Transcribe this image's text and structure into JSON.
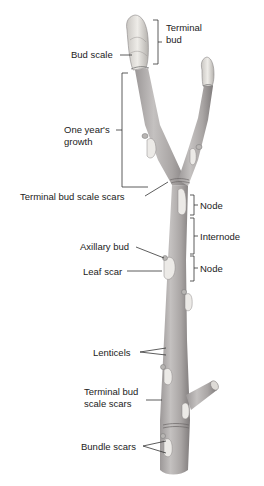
{
  "diagram": {
    "labels": {
      "terminal_bud_1": "Terminal",
      "terminal_bud_2": "bud",
      "bud_scale": "Bud scale",
      "one_years_growth_1": "One year's",
      "one_years_growth_2": "growth",
      "terminal_bud_scale_scars_top": "Terminal bud scale scars",
      "node_top": "Node",
      "internode": "Internode",
      "node_bottom": "Node",
      "axillary_bud": "Axillary bud",
      "leaf_scar": "Leaf scar",
      "lenticels": "Lenticels",
      "terminal_bud_scale_scars_bottom_1": "Terminal bud",
      "terminal_bud_scale_scars_bottom_2": "scale scars",
      "bundle_scars": "Bundle scars"
    },
    "colors": {
      "background": "#ffffff",
      "stem_fill": "#b7b4b4",
      "stem_shadow": "#8a8686",
      "bud_fill": "#dcdad6",
      "scar_fill": "#ecebe8",
      "leader_line": "#333333",
      "label_text": "#222222"
    }
  }
}
